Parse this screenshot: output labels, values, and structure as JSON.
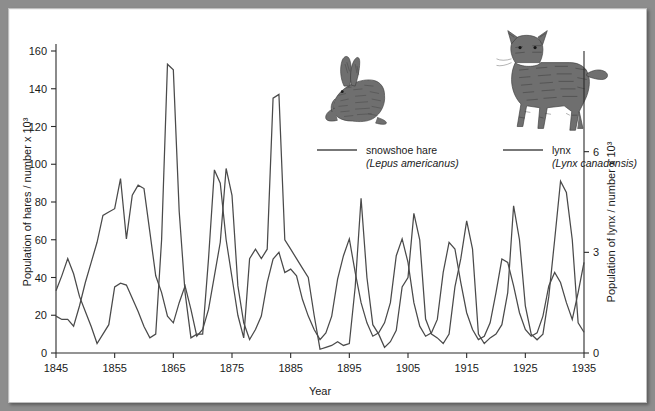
{
  "chart_data": {
    "type": "line",
    "title": "",
    "xlabel": "Year",
    "ylabel": "Population of hares / number x 10³",
    "y2label": "Population of lynx / number x 10³",
    "xlim": [
      1845,
      1935
    ],
    "ylim": [
      0,
      160
    ],
    "y2lim": [
      0,
      9
    ],
    "grid": false,
    "legend_position": "top-center-right",
    "xticks": [
      1845,
      1855,
      1865,
      1875,
      1885,
      1895,
      1905,
      1915,
      1925,
      1935
    ],
    "xtick_labels": [
      "1845",
      "1855",
      "1865",
      "1875",
      "1885",
      "1895",
      "1905",
      "1915",
      "1925",
      "1935"
    ],
    "yticks": [
      0,
      20,
      40,
      60,
      80,
      100,
      120,
      140,
      160
    ],
    "ytick_labels": [
      "0",
      "20",
      "40",
      "60",
      "80",
      "100",
      "120",
      "140",
      "160"
    ],
    "y2ticks": [
      0,
      3,
      6
    ],
    "y2tick_labels": [
      "0",
      "3",
      "6"
    ],
    "x": [
      1845,
      1846,
      1847,
      1848,
      1849,
      1850,
      1851,
      1852,
      1853,
      1854,
      1855,
      1856,
      1857,
      1858,
      1859,
      1860,
      1861,
      1862,
      1863,
      1864,
      1865,
      1866,
      1867,
      1868,
      1869,
      1870,
      1871,
      1872,
      1873,
      1874,
      1875,
      1876,
      1877,
      1878,
      1879,
      1880,
      1881,
      1882,
      1883,
      1884,
      1885,
      1886,
      1887,
      1888,
      1889,
      1890,
      1891,
      1892,
      1893,
      1894,
      1895,
      1896,
      1897,
      1898,
      1899,
      1900,
      1901,
      1902,
      1903,
      1904,
      1905,
      1906,
      1907,
      1908,
      1909,
      1910,
      1911,
      1912,
      1913,
      1914,
      1915,
      1916,
      1917,
      1918,
      1919,
      1920,
      1921,
      1922,
      1923,
      1924,
      1925,
      1926,
      1927,
      1928,
      1929,
      1930,
      1931,
      1932,
      1933,
      1934,
      1935
    ],
    "series": [
      {
        "name": "snowshoe hare",
        "scientific_name": "Lepus americanus",
        "axis": "left",
        "units": "number x 10^3",
        "values": [
          33,
          41,
          50,
          42,
          30,
          22,
          14,
          5,
          10,
          15,
          35,
          37,
          36,
          29,
          22,
          14,
          8,
          10,
          60,
          153,
          150,
          75,
          32,
          8,
          10,
          10,
          50,
          97,
          90,
          60,
          40,
          20,
          8,
          50,
          55,
          50,
          55,
          135,
          137,
          60,
          55,
          50,
          45,
          40,
          20,
          2,
          3,
          4,
          6,
          4,
          5,
          35,
          82,
          40,
          15,
          10,
          3,
          6,
          12,
          35,
          40,
          74,
          60,
          18,
          10,
          8,
          5,
          10,
          35,
          50,
          70,
          55,
          10,
          5,
          8,
          10,
          15,
          32,
          78,
          60,
          25,
          10,
          7,
          10,
          30,
          60,
          91,
          85,
          60,
          16,
          11
        ]
      },
      {
        "name": "lynx",
        "scientific_name": "Lynx canadensis",
        "axis": "right",
        "units": "number x 10^3",
        "values": [
          1.1,
          1.0,
          1.0,
          0.8,
          1.4,
          2.1,
          2.7,
          3.3,
          4.1,
          4.2,
          4.3,
          5.2,
          3.4,
          4.7,
          5.0,
          4.9,
          3.6,
          2.3,
          1.8,
          1.1,
          0.9,
          1.5,
          2.0,
          1.3,
          0.5,
          0.7,
          1.3,
          2.3,
          3.3,
          5.5,
          4.7,
          2.0,
          0.9,
          0.4,
          0.7,
          1.1,
          2.1,
          2.8,
          3.0,
          2.4,
          2.5,
          2.3,
          1.6,
          1.1,
          0.7,
          0.4,
          0.6,
          1.1,
          2.2,
          2.9,
          3.4,
          2.4,
          1.5,
          0.9,
          0.5,
          0.6,
          0.9,
          1.5,
          2.9,
          3.4,
          2.7,
          1.5,
          0.8,
          0.5,
          0.6,
          1.0,
          2.4,
          3.3,
          3.1,
          2.1,
          1.2,
          0.7,
          0.4,
          0.5,
          0.9,
          1.8,
          2.8,
          2.7,
          2.0,
          1.2,
          0.7,
          0.5,
          0.6,
          1.1,
          2.0,
          2.4,
          2.1,
          1.5,
          1.0,
          1.8,
          2.7
        ]
      }
    ]
  },
  "legend": {
    "hare": {
      "label": "snowshoe hare",
      "sci": "(Lepus americanus)"
    },
    "lynx": {
      "label": "lynx",
      "sci": "(Lynx canadensis)"
    }
  },
  "axes": {
    "x_title": "Year",
    "y_left_title": "Population of hares / number x 10³",
    "y_right_title": "Population of lynx / number x 10³"
  },
  "colors": {
    "line": "#4a4a4a",
    "axis": "#2b2b2b",
    "text": "#1a1a1a",
    "page_background": "#8d8d8d",
    "plot_background": "#ffffff"
  },
  "illustrations": {
    "hare": "snowshoe-hare-illustration",
    "lynx": "lynx-illustration"
  }
}
